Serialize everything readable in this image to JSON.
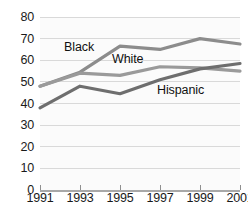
{
  "chart_data": {
    "type": "line",
    "title": "",
    "subtitle": "",
    "xlabel": "",
    "ylabel": "",
    "x": [
      1991,
      1993,
      1995,
      1997,
      1999,
      2001
    ],
    "categories": [
      "1991",
      "1993",
      "1995",
      "1997",
      "1999",
      "2001"
    ],
    "xlim": [
      1991,
      2001
    ],
    "ylim": [
      0,
      80
    ],
    "yticks": [
      0,
      10,
      20,
      30,
      40,
      50,
      60,
      70,
      80
    ],
    "ytick_labels": [
      "0",
      "10",
      "20",
      "30",
      "40",
      "50",
      "60",
      "70",
      "80"
    ],
    "xtick_labels": [
      "1991",
      "1993",
      "1995",
      "1997",
      "1999",
      "2001"
    ],
    "grid": "horizontal",
    "legend_position": "inline-labels",
    "series": [
      {
        "name": "Black",
        "label": "Black",
        "color": "#8c8c8c",
        "values": [
          48,
          54.5,
          66.5,
          65,
          70,
          67.5
        ]
      },
      {
        "name": "White",
        "label": "White",
        "color": "#9a9a9a",
        "values": [
          48,
          54,
          53,
          57,
          56.5,
          55
        ]
      },
      {
        "name": "Hispanic",
        "label": "Hispanic",
        "color": "#6e6e6e",
        "values": [
          38,
          48,
          44.5,
          51,
          56,
          58.5
        ]
      }
    ]
  },
  "axis": {
    "baseline_color": "#a8a8a8",
    "gridline_color": "#d9d9d9",
    "text_color": "#1a1a1a"
  },
  "ytick_0": "0",
  "ytick_1": "10",
  "ytick_2": "20",
  "ytick_3": "30",
  "ytick_4": "40",
  "ytick_5": "50",
  "ytick_6": "60",
  "ytick_7": "70",
  "ytick_8": "80",
  "xtick_0": "1991",
  "xtick_1": "1993",
  "xtick_2": "1995",
  "xtick_3": "1997",
  "xtick_4": "1999",
  "xtick_5": "2001",
  "label_black": "Black",
  "label_white": "White",
  "label_hispanic": "Hispanic"
}
